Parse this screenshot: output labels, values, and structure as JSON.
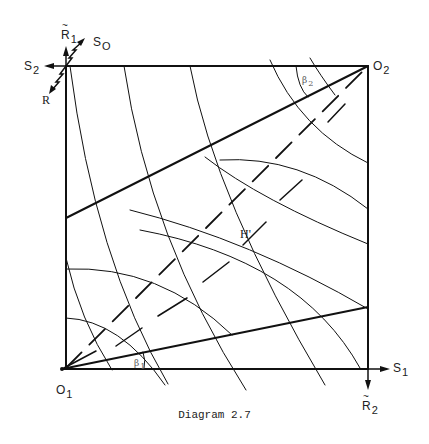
{
  "diagram": {
    "caption": "Diagram 2.7",
    "origins": {
      "o1": {
        "letter": "O",
        "sub": "1"
      },
      "o2": {
        "letter": "O",
        "sub": "2"
      }
    },
    "axes": {
      "s1": {
        "letter": "S",
        "sub": "1"
      },
      "s2": {
        "letter": "S",
        "sub": "2"
      },
      "r1_tilde": {
        "letter": "R",
        "sub": "1"
      },
      "r2_tilde": {
        "letter": "R",
        "sub": "2"
      },
      "so": {
        "letter": "S",
        "sub": "O"
      },
      "r": {
        "letter": "R"
      }
    },
    "angles": {
      "beta1": {
        "letter": "β",
        "sub": "1"
      },
      "beta2": {
        "letter": "β",
        "sub": "2"
      }
    },
    "point_h": "H'",
    "colors": {
      "line": "#111111",
      "angle_label": "#555555"
    }
  }
}
